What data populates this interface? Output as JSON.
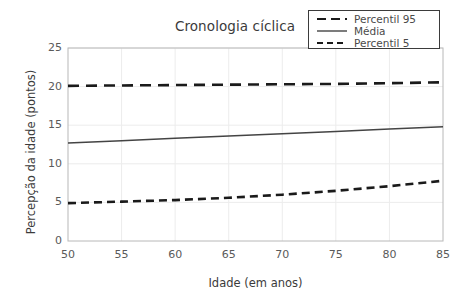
{
  "chart_data": {
    "type": "line",
    "title": "Cronologia cíclica",
    "xlabel": "Idade (em anos)",
    "ylabel": "Percepção da idade (pontos)",
    "xlim": [
      50,
      85
    ],
    "ylim": [
      0,
      25
    ],
    "xticks": [
      50,
      55,
      60,
      65,
      70,
      75,
      80,
      85
    ],
    "yticks": [
      0,
      5,
      10,
      15,
      20,
      25
    ],
    "grid": true,
    "legend_position": "top-right",
    "x": [
      50,
      55,
      60,
      65,
      70,
      75,
      80,
      85
    ],
    "series": [
      {
        "name": "Percentil 95",
        "style": "dashed-long",
        "color": "#1a1a1a",
        "values": [
          20.1,
          20.15,
          20.2,
          20.25,
          20.3,
          20.35,
          20.45,
          20.55
        ]
      },
      {
        "name": "Média",
        "style": "solid",
        "color": "#444444",
        "values": [
          12.7,
          13.0,
          13.3,
          13.6,
          13.9,
          14.2,
          14.5,
          14.8
        ]
      },
      {
        "name": "Percentil 5",
        "style": "dashed-short",
        "color": "#1a1a1a",
        "values": [
          4.9,
          5.1,
          5.3,
          5.6,
          6.0,
          6.5,
          7.1,
          7.8
        ]
      }
    ]
  },
  "legend": {
    "items": [
      {
        "label": "Percentil 95"
      },
      {
        "label": "Média"
      },
      {
        "label": "Percentil 5"
      }
    ]
  },
  "axes": {
    "y_tick_labels": [
      "25",
      "20",
      "15",
      "10",
      "5",
      "0"
    ],
    "x_tick_labels": [
      "50",
      "55",
      "60",
      "65",
      "70",
      "75",
      "80",
      "85"
    ]
  },
  "colors": {
    "background": "#ffffff",
    "grid": "#ececec",
    "axis": "#b8b8b8",
    "text": "#3b3b3b",
    "line_dark": "#1a1a1a",
    "line_mean": "#444444"
  }
}
